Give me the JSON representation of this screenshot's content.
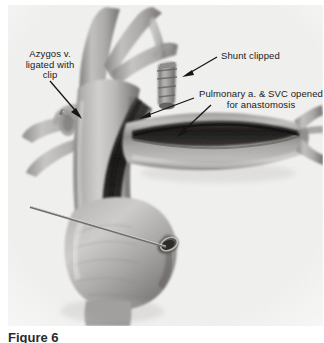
{
  "figure": {
    "caption": "Figure 6",
    "kind": "medical-illustration",
    "medium": "grayscale halftone scan"
  },
  "annotations": {
    "azygos": {
      "text": "Azygos v.\nligated with\nclip",
      "align": "center"
    },
    "shunt": {
      "text": "Shunt clipped",
      "align": "left"
    },
    "pulmonary": {
      "text": "Pulmonary a. & SVC opened\nfor anastomosis",
      "align": "center"
    }
  },
  "colors": {
    "plate_background": "#f1f1f0",
    "page_background": "#ffffff",
    "annotation_text": "#1a1a1a",
    "caption_text": "#2b2b2b",
    "leader_line": "#111111",
    "vessel_light": "#cfcdcb",
    "vessel_mid": "#9a9896",
    "vessel_dark": "#6b6866",
    "vessel_shadow": "#4a4745",
    "incision_dark": "#2a2826",
    "incision_deep": "#171514",
    "clip_metal": "#7d7b79",
    "probe_metal": "#8e8c8a"
  },
  "structures": [
    {
      "name": "superior-vena-cava",
      "label": "Superior vena cava (SVC)"
    },
    {
      "name": "innominate-vein-branches",
      "label": "Innominate / brachiocephalic branches"
    },
    {
      "name": "azygos-vein-stump",
      "label": "Azygos vein stump"
    },
    {
      "name": "surgical-clip",
      "label": "Surgical clip on azygos vein"
    },
    {
      "name": "clipped-shunt",
      "label": "Clipped systemic-to-pulmonary shunt"
    },
    {
      "name": "pulmonary-artery",
      "label": "Pulmonary artery, opened longitudinally"
    },
    {
      "name": "pulmonary-artery-bifurcation",
      "label": "Pulmonary artery bifurcation"
    },
    {
      "name": "svc-incision",
      "label": "Longitudinal SVC incision"
    },
    {
      "name": "right-atrium",
      "label": "Right atrial appendage / cardiac mass"
    },
    {
      "name": "probe",
      "label": "Probe entering atrial opening"
    },
    {
      "name": "atrial-opening",
      "label": "Atrial opening"
    }
  ],
  "leaders": [
    {
      "name": "leader-azygos",
      "from_label": "azygos",
      "to_structure": "surgical-clip"
    },
    {
      "name": "leader-shunt",
      "from_label": "shunt",
      "to_structure": "clipped-shunt"
    },
    {
      "name": "leader-pulmonary-svc",
      "from_label": "pulmonary",
      "to_structure": "svc-incision"
    },
    {
      "name": "leader-pulmonary-artery",
      "from_label": "pulmonary",
      "to_structure": "pulmonary-artery"
    }
  ]
}
